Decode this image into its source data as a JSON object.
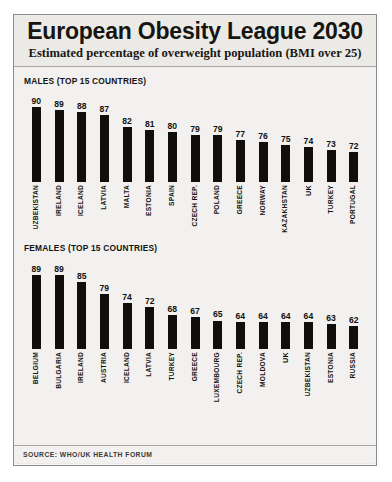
{
  "header": {
    "title": "European Obesity League 2030",
    "subtitle": "Estimated percentage of overweight population (BMI over 25)"
  },
  "sections": {
    "males_head": "MALES (TOP 15 COUNTRIES)",
    "females_head": "FEMALES (TOP 15 COUNTRIES)"
  },
  "footer": {
    "source": "SOURCE: WHO/UK HEALTH FORUM"
  },
  "colors": {
    "bar": "#100f0d",
    "panel": "#eceae7",
    "body": "#f2f1ef",
    "border": "#8e8c8a",
    "text": "#17150f"
  },
  "chart_data": [
    {
      "type": "bar",
      "title": "MALES (TOP 15 COUNTRIES)",
      "xlabel": "",
      "ylabel": "",
      "ylim": [
        60,
        92
      ],
      "grid": false,
      "legend": "none",
      "highlight": "UK",
      "categories": [
        "UZBEKISTAN",
        "IRELAND",
        "ICELAND",
        "LATVIA",
        "MALTA",
        "ESTONIA",
        "SPAIN",
        "CZECH REP.",
        "POLAND",
        "GREECE",
        "NORWAY",
        "KAZAKHSTAN",
        "UK",
        "TURKEY",
        "PORTUGAL"
      ],
      "values": [
        90,
        89,
        88,
        87,
        82,
        81,
        80,
        79,
        79,
        77,
        76,
        75,
        74,
        73,
        72
      ]
    },
    {
      "type": "bar",
      "title": "FEMALES (TOP 15 COUNTRIES)",
      "xlabel": "",
      "ylabel": "",
      "ylim": [
        50,
        92
      ],
      "grid": false,
      "legend": "none",
      "highlight": "UK",
      "categories": [
        "BELGIUM",
        "BULGARIA",
        "IRELAND",
        "AUSTRIA",
        "ICELAND",
        "LATVIA",
        "TURKEY",
        "GREECE",
        "LUXEMBOURG",
        "CZECH REP.",
        "MOLDOVA",
        "UK",
        "UZBEKISTAN",
        "ESTONIA",
        "RUSSIA"
      ],
      "values": [
        89,
        89,
        85,
        79,
        74,
        72,
        68,
        67,
        65,
        64,
        64,
        64,
        64,
        63,
        62
      ]
    }
  ]
}
